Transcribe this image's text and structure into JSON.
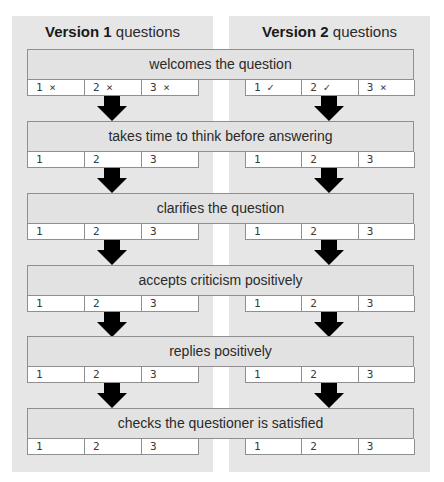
{
  "columns": [
    {
      "title_bold": "Version 1",
      "title_rest": " questions"
    },
    {
      "title_bold": "Version 2",
      "title_rest": " questions"
    }
  ],
  "steps": [
    {
      "label": "welcomes the question",
      "v1": [
        "1 ×",
        "2 ×",
        "3 ×"
      ],
      "v2": [
        "1 ✓",
        "2 ✓",
        "3 ×"
      ]
    },
    {
      "label": "takes time to think before answering",
      "v1": [
        "1",
        "2",
        "3"
      ],
      "v2": [
        "1",
        "2",
        "3"
      ]
    },
    {
      "label": "clarifies the question",
      "v1": [
        "1",
        "2",
        "3"
      ],
      "v2": [
        "1",
        "2",
        "3"
      ]
    },
    {
      "label": "accepts criticism positively",
      "v1": [
        "1",
        "2",
        "3"
      ],
      "v2": [
        "1",
        "2",
        "3"
      ]
    },
    {
      "label": "replies positively",
      "v1": [
        "1",
        "2",
        "3"
      ],
      "v2": [
        "1",
        "2",
        "3"
      ]
    },
    {
      "label": "checks the questioner is satisfied",
      "v1": [
        "1",
        "2",
        "3"
      ],
      "v2": [
        "1",
        "2",
        "3"
      ]
    }
  ],
  "icons": {
    "arrow": "down-arrow-icon",
    "cross": "×",
    "check": "✓"
  },
  "colors": {
    "panel": "#e6e6e6",
    "bar": "#e2e2e2",
    "border": "#8f8f8f",
    "arrow": "#000000"
  }
}
